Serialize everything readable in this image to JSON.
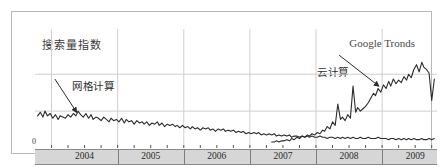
{
  "figure": {
    "y_axis_caption": "搜索量指数",
    "brand_watermark": "Google Tronds",
    "zero_tick": "0"
  },
  "annotations": {
    "grid_computing": "网格计算",
    "cloud_computing": "云计算"
  },
  "chart_data": {
    "type": "line",
    "title": "",
    "subtitle": "",
    "xlabel": "",
    "ylabel": "搜索量指数",
    "grid": true,
    "legend_position": "none",
    "xlim": [
      2003.75,
      2009.83
    ],
    "ylim": [
      0,
      100
    ],
    "x_tick_labels": [
      "2004",
      "2005",
      "2006",
      "2007",
      "2008",
      "2009"
    ],
    "x_tick_values": [
      2004.5,
      2005.5,
      2006.5,
      2007.5,
      2008.5,
      2009.5
    ],
    "y_tick_labels": [
      "0"
    ],
    "y_tick_values": [
      0
    ],
    "gridline_y_values": [
      62,
      31
    ],
    "annotations": [
      {
        "label": "网格计算",
        "series": "网格计算",
        "text_x": 2004.05,
        "text_y": 58,
        "point_x": 2004.38,
        "point_y": 30
      },
      {
        "label": "云计算",
        "series": "云计算",
        "text_x": 2008.35,
        "text_y": 78,
        "point_x": 2008.95,
        "point_y": 52
      }
    ],
    "series": [
      {
        "name": "网格计算",
        "color": "#2b2b2b",
        "x": [
          2003.79,
          2003.83,
          2003.87,
          2003.9,
          2003.94,
          2003.98,
          2004.02,
          2004.06,
          2004.1,
          2004.13,
          2004.17,
          2004.21,
          2004.25,
          2004.29,
          2004.33,
          2004.37,
          2004.4,
          2004.44,
          2004.48,
          2004.52,
          2004.56,
          2004.6,
          2004.63,
          2004.67,
          2004.71,
          2004.75,
          2004.79,
          2004.83,
          2004.87,
          2004.9,
          2004.94,
          2004.98,
          2005.02,
          2005.06,
          2005.1,
          2005.13,
          2005.17,
          2005.21,
          2005.25,
          2005.29,
          2005.33,
          2005.37,
          2005.4,
          2005.44,
          2005.48,
          2005.52,
          2005.56,
          2005.6,
          2005.63,
          2005.67,
          2005.71,
          2005.75,
          2005.79,
          2005.83,
          2005.87,
          2005.9,
          2005.94,
          2005.98,
          2006.02,
          2006.06,
          2006.1,
          2006.13,
          2006.17,
          2006.21,
          2006.25,
          2006.29,
          2006.33,
          2006.37,
          2006.4,
          2006.44,
          2006.48,
          2006.52,
          2006.56,
          2006.6,
          2006.63,
          2006.67,
          2006.71,
          2006.75,
          2006.79,
          2006.83,
          2006.87,
          2006.9,
          2006.94,
          2006.98,
          2007.02,
          2007.06,
          2007.1,
          2007.13,
          2007.17,
          2007.21,
          2007.25,
          2007.29,
          2007.33,
          2007.37,
          2007.4,
          2007.44,
          2007.48,
          2007.52,
          2007.56,
          2007.6,
          2007.63,
          2007.67,
          2007.71,
          2007.75,
          2007.79,
          2007.83,
          2007.87,
          2007.9,
          2007.94,
          2007.98,
          2008.02,
          2008.06,
          2008.1,
          2008.13,
          2008.17,
          2008.21,
          2008.25,
          2008.29,
          2008.33,
          2008.37,
          2008.4,
          2008.44,
          2008.48,
          2008.52,
          2008.56,
          2008.6,
          2008.63,
          2008.67,
          2008.71,
          2008.75,
          2008.79,
          2008.83,
          2008.87,
          2008.9,
          2008.94,
          2008.98,
          2009.02,
          2009.06,
          2009.1,
          2009.13,
          2009.17,
          2009.21,
          2009.25,
          2009.29,
          2009.33,
          2009.37,
          2009.4,
          2009.44,
          2009.48,
          2009.52,
          2009.56,
          2009.6,
          2009.63,
          2009.67,
          2009.71,
          2009.75,
          2009.79
        ],
        "y": [
          27,
          30,
          26,
          31,
          27,
          29,
          25,
          28,
          24,
          27,
          26,
          25,
          28,
          26,
          29,
          27,
          31,
          28,
          26,
          29,
          25,
          28,
          24,
          26,
          25,
          23,
          26,
          24,
          22,
          25,
          23,
          24,
          22,
          25,
          21,
          24,
          22,
          23,
          20,
          23,
          21,
          22,
          20,
          22,
          19,
          21,
          20,
          22,
          19,
          21,
          18,
          20,
          19,
          20,
          18,
          19,
          17,
          19,
          17,
          18,
          16,
          18,
          16,
          17,
          15,
          17,
          16,
          17,
          15,
          16,
          14,
          16,
          15,
          16,
          14,
          15,
          14,
          15,
          13,
          14,
          13,
          14,
          12,
          13,
          12,
          13,
          12,
          13,
          11,
          12,
          11,
          12,
          11,
          12,
          10,
          11,
          10,
          11,
          10,
          11,
          9,
          10,
          10,
          9,
          10,
          9,
          10,
          9,
          10,
          9,
          9,
          10,
          9,
          9,
          8,
          9,
          9,
          8,
          9,
          8,
          9,
          8,
          9,
          8,
          9,
          8,
          8,
          9,
          8,
          8,
          9,
          8,
          8,
          8,
          9,
          8,
          8,
          8,
          7,
          8,
          8,
          7,
          8,
          7,
          8,
          7,
          8,
          7,
          8,
          7,
          7,
          8,
          7,
          7,
          8,
          7,
          8
        ]
      },
      {
        "name": "云计算",
        "color": "#2b2b2b",
        "x": [
          2007.33,
          2007.37,
          2007.4,
          2007.44,
          2007.48,
          2007.52,
          2007.56,
          2007.6,
          2007.63,
          2007.67,
          2007.71,
          2007.75,
          2007.79,
          2007.83,
          2007.87,
          2007.9,
          2007.94,
          2007.98,
          2008.02,
          2008.06,
          2008.1,
          2008.13,
          2008.17,
          2008.21,
          2008.25,
          2008.29,
          2008.33,
          2008.37,
          2008.4,
          2008.44,
          2008.48,
          2008.52,
          2008.56,
          2008.6,
          2008.63,
          2008.67,
          2008.71,
          2008.75,
          2008.79,
          2008.83,
          2008.87,
          2008.9,
          2008.94,
          2008.98,
          2009.02,
          2009.06,
          2009.1,
          2009.13,
          2009.17,
          2009.21,
          2009.25,
          2009.29,
          2009.33,
          2009.37,
          2009.4,
          2009.44,
          2009.48,
          2009.52,
          2009.56,
          2009.6,
          2009.63,
          2009.67,
          2009.71,
          2009.75,
          2009.79
        ],
        "y": [
          5,
          5,
          6,
          5,
          6,
          6,
          7,
          6,
          8,
          7,
          9,
          8,
          10,
          9,
          11,
          10,
          12,
          11,
          13,
          12,
          15,
          14,
          18,
          16,
          22,
          19,
          37,
          24,
          26,
          23,
          28,
          25,
          52,
          30,
          34,
          31,
          33,
          35,
          38,
          42,
          46,
          44,
          50,
          47,
          53,
          50,
          56,
          52,
          58,
          54,
          57,
          55,
          60,
          57,
          62,
          59,
          66,
          70,
          64,
          72,
          68,
          66,
          63,
          40,
          58
        ]
      }
    ]
  }
}
